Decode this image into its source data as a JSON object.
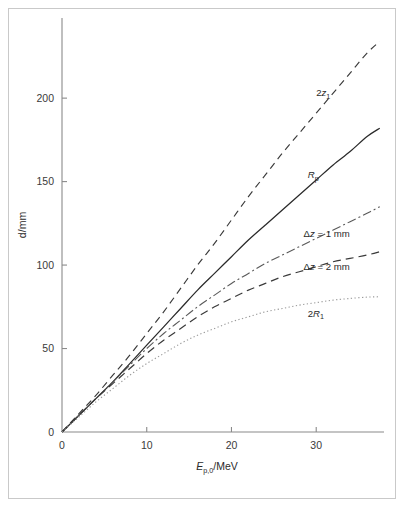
{
  "figure": {
    "name": "proton-beam-depth-vs-energy",
    "background_color": "#ffffff",
    "frame_color": "#c9c9c9",
    "axis_color": "#8a8a8a"
  },
  "chart_data": {
    "type": "line",
    "title": "",
    "subtitle": "",
    "xlabel": "E_p,0/MeV",
    "xlabel_parts": {
      "symbol": "E",
      "subscript": "p,0",
      "unit": "/MeV"
    },
    "ylabel": "d/mm",
    "ylabel_parts": {
      "symbol": "d",
      "unit": "/mm"
    },
    "xlim": [
      0,
      38
    ],
    "ylim": [
      0,
      248
    ],
    "xticks": [
      0,
      10,
      20,
      30
    ],
    "xticklabels": [
      "0",
      "10",
      "20",
      "30"
    ],
    "yticks": [
      0,
      50,
      100,
      150,
      200
    ],
    "yticklabels": [
      "0",
      "50",
      "100",
      "150",
      "200"
    ],
    "grid": false,
    "legend": "inline-annotations",
    "legend_position": "right-of-curves",
    "x": [
      0,
      2,
      4,
      6,
      8,
      10,
      12,
      14,
      16,
      18,
      20,
      22,
      24,
      26,
      28,
      30,
      32,
      34,
      36,
      37.5
    ],
    "series": [
      {
        "name": "2z1",
        "label": "2z₁",
        "label_parts": {
          "prefix": "2",
          "symbol": "z",
          "subscript": "1"
        },
        "style": "dashed",
        "color": "#3a3a3a",
        "dasharray": "7,5",
        "width": 1.15,
        "label_at": {
          "x": 30.0,
          "y": 201
        },
        "values": [
          0,
          11,
          22,
          34,
          46,
          59,
          72,
          86,
          100,
          113,
          127,
          141,
          154,
          167,
          179,
          191,
          203,
          215,
          227,
          234
        ]
      },
      {
        "name": "Rp",
        "label": "Rp",
        "label_parts": {
          "prefix": "",
          "symbol": "R",
          "subscript": "p"
        },
        "style": "solid",
        "color": "#2a2a2a",
        "dasharray": "none",
        "width": 1.25,
        "label_at": {
          "x": 29.0,
          "y": 152
        },
        "values": [
          0,
          10,
          20,
          30,
          41,
          52,
          63,
          74,
          85,
          95,
          105,
          115,
          124,
          133,
          142,
          151,
          160,
          168,
          177,
          182
        ]
      },
      {
        "name": "dz1mm",
        "label": "Δz = 1 mm",
        "style": "dash-dot",
        "color": "#5a5a5a",
        "dasharray": "9,3,2,3",
        "width": 1.1,
        "label_at": {
          "x": 28.5,
          "y": 117
        },
        "values": [
          0,
          10,
          20,
          30,
          40,
          50,
          59,
          67,
          75,
          82,
          89,
          95,
          101,
          106,
          111,
          116,
          121,
          126,
          131,
          135
        ]
      },
      {
        "name": "dz2mm",
        "label": "Δz = 2 mm",
        "style": "dashed",
        "color": "#3a3a3a",
        "dasharray": "8,5",
        "width": 1.2,
        "label_at": {
          "x": 28.5,
          "y": 97
        },
        "values": [
          0,
          10,
          20,
          29,
          38,
          47,
          55,
          62,
          69,
          75,
          80,
          85,
          89,
          93,
          96,
          99,
          102,
          104,
          106,
          108
        ]
      },
      {
        "name": "2R1",
        "label": "2R₁",
        "label_parts": {
          "prefix": "2",
          "symbol": "R",
          "subscript": "1"
        },
        "style": "dotted",
        "color": "#9a9a9a",
        "dasharray": "1.3,2.4",
        "width": 1.1,
        "label_at": {
          "x": 29.0,
          "y": 69
        },
        "values": [
          0,
          9,
          18,
          26,
          34,
          41,
          47,
          53,
          58,
          62,
          66,
          69,
          72,
          74,
          76,
          77.5,
          79,
          80,
          80.8,
          81
        ]
      }
    ]
  }
}
